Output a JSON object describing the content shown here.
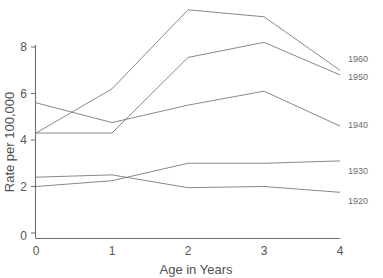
{
  "chart_data": {
    "type": "line",
    "title": "",
    "xlabel": "Age in Years",
    "ylabel": "Rate per 100,000",
    "x": [
      0,
      1,
      2,
      3,
      4
    ],
    "xticklabels": [
      "0",
      "1",
      "2",
      "3",
      "4"
    ],
    "yticklabels": [
      "0",
      "2",
      "4",
      "6",
      "8"
    ],
    "yticks": [
      0,
      2,
      4,
      6,
      8
    ],
    "xlim": [
      0,
      4
    ],
    "ylim": [
      0,
      8.8
    ],
    "grid": false,
    "legend_position": "right-end-labels",
    "series": [
      {
        "name": "1960",
        "values": [
          4.3,
          6.2,
          9.6,
          9.3,
          7.0
        ]
      },
      {
        "name": "1950",
        "values": [
          4.3,
          4.3,
          7.55,
          8.2,
          6.8
        ]
      },
      {
        "name": "1940",
        "values": [
          5.6,
          4.75,
          5.5,
          6.1,
          4.6
        ]
      },
      {
        "name": "1930",
        "values": [
          2.0,
          2.25,
          3.0,
          3.0,
          3.1
        ]
      },
      {
        "name": "1920",
        "values": [
          2.4,
          2.5,
          1.95,
          2.0,
          1.75
        ]
      }
    ]
  },
  "labels": {
    "series_1960": "1960",
    "series_1950": "1950",
    "series_1940": "1940",
    "series_1930": "1930",
    "series_1920": "1920",
    "xlabel": "Age in Years",
    "ylabel": "Rate per 100,000",
    "ytick_0": "0",
    "ytick_2": "2",
    "ytick_4": "4",
    "ytick_6": "6",
    "ytick_8": "8",
    "xtick_0": "0",
    "xtick_1": "1",
    "xtick_2": "2",
    "xtick_3": "3",
    "xtick_4": "4"
  },
  "colors": {
    "line": "#7a7a7a",
    "axis": "#6e6e6e",
    "text": "#555555",
    "background": "#ffffff"
  }
}
